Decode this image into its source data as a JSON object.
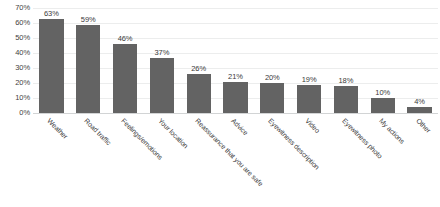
{
  "chart_data": {
    "type": "bar",
    "title": "",
    "subtitle": "",
    "xlabel": "",
    "ylabel": "",
    "ylim": [
      0,
      70
    ],
    "ytick_labels": [
      "70%",
      "60%",
      "50%",
      "40%",
      "30%",
      "20%",
      "10%",
      "0%"
    ],
    "yticks": [
      70,
      60,
      50,
      40,
      30,
      20,
      10,
      0
    ],
    "grid": true,
    "legend": false,
    "legend_position": "none",
    "value_label_suffix": "%",
    "orientation": "vertical",
    "categories": [
      "Weather",
      "Road traffic",
      "Feelings/emotions",
      "Your location",
      "Reassurance that you are safe",
      "Advice",
      "Eyewitness description",
      "Video",
      "Eyewitness photo",
      "My actions",
      "Other"
    ],
    "values": [
      63,
      59,
      46,
      37,
      26,
      21,
      20,
      19,
      18,
      10,
      4
    ],
    "value_labels": [
      "63%",
      "59%",
      "46%",
      "37%",
      "26%",
      "21%",
      "20%",
      "19%",
      "18%",
      "10%",
      "4%"
    ],
    "series": [
      {
        "name": "Responses",
        "values": [
          63,
          59,
          46,
          37,
          26,
          21,
          20,
          19,
          18,
          10,
          4
        ]
      }
    ],
    "colors": {
      "bar": "#636363",
      "gridline": "#eceded",
      "axis_line": "#d2d4d5",
      "text": "#3a3a3a",
      "background": "#ffffff"
    }
  }
}
